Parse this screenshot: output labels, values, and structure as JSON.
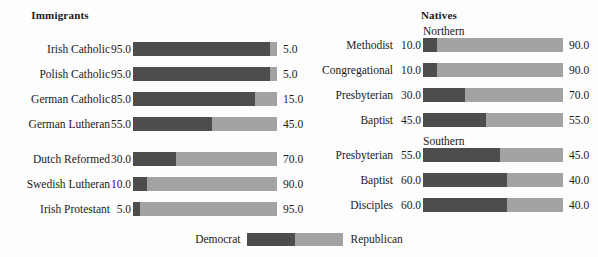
{
  "chart_data": {
    "type": "bar",
    "orientation": "horizontal",
    "stacked": true,
    "legend": {
      "position": "bottom-center",
      "entries": [
        {
          "name": "Democrat",
          "color": "#4d4d4d"
        },
        {
          "name": "Republican",
          "color": "#a3a3a3"
        }
      ]
    },
    "xlabel": "",
    "ylabel": "",
    "xlim": [
      0,
      100
    ],
    "grid": false,
    "series": [
      {
        "name": "Democrat",
        "color": "#4d4d4d"
      },
      {
        "name": "Republican",
        "color": "#a3a3a3"
      }
    ],
    "panels": [
      {
        "title": "Immigrants",
        "groups": [
          {
            "heading": "",
            "rows": [
              {
                "label": "Irish Catholic",
                "democrat": 95.0,
                "republican": 5.0,
                "left_value": "95.0",
                "right_value": "5.0"
              },
              {
                "label": "Polish Catholic",
                "democrat": 95.0,
                "republican": 5.0,
                "left_value": "95.0",
                "right_value": "5.0"
              },
              {
                "label": "German Catholic",
                "democrat": 85.0,
                "republican": 15.0,
                "left_value": "85.0",
                "right_value": "15.0"
              },
              {
                "label": "German Lutheran",
                "democrat": 55.0,
                "republican": 45.0,
                "left_value": "55.0",
                "right_value": "45.0"
              }
            ]
          },
          {
            "heading": "",
            "rows": [
              {
                "label": "Dutch Reformed",
                "democrat": 30.0,
                "republican": 70.0,
                "left_value": "30.0",
                "right_value": "70.0"
              },
              {
                "label": "Swedish Lutheran",
                "democrat": 10.0,
                "republican": 90.0,
                "left_value": "10.0",
                "right_value": "90.0"
              },
              {
                "label": "Irish Protestant",
                "democrat": 5.0,
                "republican": 95.0,
                "left_value": "5.0",
                "right_value": "95.0"
              }
            ]
          }
        ]
      },
      {
        "title": "Natives",
        "groups": [
          {
            "heading": "Northern",
            "rows": [
              {
                "label": "Methodist",
                "democrat": 10.0,
                "republican": 90.0,
                "left_value": "10.0",
                "right_value": "90.0"
              },
              {
                "label": "Congregational",
                "democrat": 10.0,
                "republican": 90.0,
                "left_value": "10.0",
                "right_value": "90.0"
              },
              {
                "label": "Presbyterian",
                "democrat": 30.0,
                "republican": 70.0,
                "left_value": "30.0",
                "right_value": "70.0"
              },
              {
                "label": "Baptist",
                "democrat": 45.0,
                "republican": 55.0,
                "left_value": "45.0",
                "right_value": "55.0"
              }
            ]
          },
          {
            "heading": "Southern",
            "rows": [
              {
                "label": "Presbyterian",
                "democrat": 55.0,
                "republican": 45.0,
                "left_value": "55.0",
                "right_value": "45.0"
              },
              {
                "label": "Baptist",
                "democrat": 60.0,
                "republican": 40.0,
                "left_value": "60.0",
                "right_value": "40.0"
              },
              {
                "label": "Disciples",
                "democrat": 60.0,
                "republican": 40.0,
                "left_value": "60.0",
                "right_value": "40.0"
              }
            ]
          }
        ]
      }
    ]
  },
  "colors": {
    "democrat": "#4d4d4d",
    "republican": "#a3a3a3",
    "background": "#fdfdfd",
    "text": "#1a1a1a"
  }
}
